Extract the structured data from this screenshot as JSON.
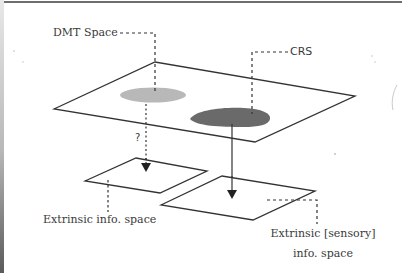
{
  "diagram": {
    "labels": {
      "dmt_space": "DMT Space",
      "crs": "CRS",
      "question": "?",
      "extrinsic_info_space": "Extrinsic info. space",
      "extrinsic_sensory_line1": "Extrinsic [sensory]",
      "extrinsic_sensory_line2": "info. space"
    },
    "planes": [
      {
        "name": "dmt-crs-plane",
        "points": "54,109 155,62 355,96 255,142"
      },
      {
        "name": "extrinsic-info-plane",
        "points": "85,181 136,158 207,171 160,193"
      },
      {
        "name": "extrinsic-sensory-plane",
        "points": "161,205 222,176 315,191 253,220"
      }
    ],
    "regions": [
      {
        "name": "dmt-space-region",
        "color": "#b8b8b8"
      },
      {
        "name": "crs-region",
        "color": "#6a6a6a"
      }
    ],
    "arrows": [
      {
        "name": "dmt-to-extrinsic-arrow",
        "style": "dotted",
        "uncertain": true
      },
      {
        "name": "crs-to-sensory-arrow",
        "style": "solid"
      }
    ],
    "colors": {
      "line": "#333333",
      "text": "#3a3a3a",
      "light_region": "#b8b8b8",
      "dark_region": "#6a6a6a"
    }
  }
}
